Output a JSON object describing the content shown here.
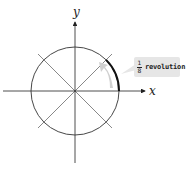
{
  "diagram": {
    "axes": {
      "x_label": "x",
      "y_label": "y"
    },
    "circle": {
      "center": [
        75,
        91
      ],
      "radius": 44
    },
    "diagonals": [
      "45°",
      "135°"
    ],
    "highlighted_arc": {
      "from_deg": 0,
      "to_deg": 45
    },
    "callout": {
      "fraction_numerator": "1",
      "fraction_denominator": "8",
      "label": "revolution"
    },
    "colors": {
      "line": "#222222",
      "arrow_fill": "#d0d0d0",
      "callout_bg": "#e6e6e6"
    }
  }
}
